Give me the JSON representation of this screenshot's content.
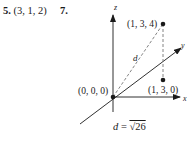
{
  "answers": [
    {
      "number": "5.",
      "value": "(3, 1, 2)"
    },
    {
      "number": "7.",
      "value": ""
    }
  ],
  "figure": {
    "axes": {
      "x_label": "x",
      "y_label": "y",
      "z_label": "z"
    },
    "points": [
      {
        "label": "(0, 0, 0)",
        "coords": [
          0,
          0,
          0
        ]
      },
      {
        "label": "(1, 3, 4)",
        "coords": [
          1,
          3,
          4
        ]
      },
      {
        "label": "(1, 3, 0)",
        "coords": [
          1,
          3,
          0
        ]
      }
    ],
    "distance_label": "d",
    "caption": {
      "lhs": "d",
      "eq": " = ",
      "rhs": "√26"
    }
  }
}
